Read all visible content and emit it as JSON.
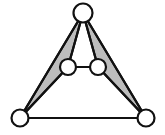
{
  "figure": {
    "background_color": "#ffffff",
    "width": 165,
    "height": 135
  },
  "style": {
    "edge_color": "#111111",
    "edge_width": 2.2,
    "node_fill": "#ffffff",
    "node_stroke": "#111111",
    "node_stroke_width": 2.2,
    "shade_fill": "#bdbdbd",
    "shade_stroke": "#111111"
  },
  "chart_data": {
    "type": "diagram",
    "nodes": [
      {
        "id": "apex",
        "label": "",
        "x": 83,
        "y": 13,
        "r": 9.5
      },
      {
        "id": "mid-left",
        "label": "",
        "x": 68,
        "y": 67,
        "r": 8
      },
      {
        "id": "mid-right",
        "label": "",
        "x": 98,
        "y": 67,
        "r": 8
      },
      {
        "id": "bottom-left",
        "label": "",
        "x": 20,
        "y": 118,
        "r": 8.5
      },
      {
        "id": "bottom-right",
        "label": "",
        "x": 146,
        "y": 118,
        "r": 8.5
      }
    ],
    "edges": [
      {
        "id": "apex-mid-left",
        "from": "apex",
        "to": "mid-left"
      },
      {
        "id": "apex-mid-right",
        "from": "apex",
        "to": "mid-right"
      },
      {
        "id": "apex-bottom-left",
        "from": "apex",
        "to": "bottom-left"
      },
      {
        "id": "apex-bottom-right",
        "from": "apex",
        "to": "bottom-right"
      },
      {
        "id": "mid-left-mid-right",
        "from": "mid-left",
        "to": "mid-right"
      },
      {
        "id": "mid-left-bottom-left",
        "from": "mid-left",
        "to": "bottom-left"
      },
      {
        "id": "mid-right-bottom-right",
        "from": "mid-right",
        "to": "bottom-right"
      },
      {
        "id": "bottom-left-bottom-right",
        "from": "bottom-left",
        "to": "bottom-right"
      }
    ],
    "shaded_faces": [
      {
        "id": "left-face",
        "vertices": [
          "apex",
          "mid-left",
          "bottom-left"
        ],
        "fill": "#bdbdbd"
      },
      {
        "id": "right-face",
        "vertices": [
          "apex",
          "mid-right",
          "bottom-right"
        ],
        "fill": "#bdbdbd"
      }
    ],
    "node_count": 5,
    "edge_count": 8,
    "shaded_face_count": 2
  }
}
